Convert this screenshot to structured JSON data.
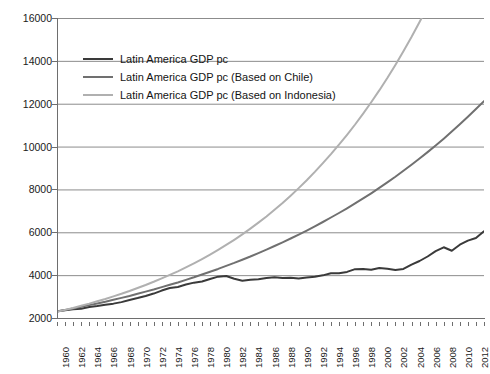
{
  "chart_data": {
    "type": "line",
    "title": "",
    "subtitle": "",
    "xlabel": "",
    "ylabel": "",
    "xlim": [
      1960,
      2013
    ],
    "ylim": [
      2000,
      16000
    ],
    "grid": true,
    "legend_position": "inside-upper-left",
    "y_ticks": [
      2000,
      4000,
      6000,
      8000,
      10000,
      12000,
      14000,
      16000
    ],
    "x_tick_labels": [
      "1960",
      "1962",
      "1964",
      "1966",
      "1968",
      "1970",
      "1972",
      "1974",
      "1976",
      "1978",
      "1980",
      "1982",
      "1984",
      "1986",
      "1988",
      "1990",
      "1992",
      "1994",
      "1996",
      "1998",
      "2000",
      "2002",
      "2004",
      "2006",
      "2008",
      "2010",
      "2012"
    ],
    "x": [
      1960,
      1961,
      1962,
      1963,
      1964,
      1965,
      1966,
      1967,
      1968,
      1969,
      1970,
      1971,
      1972,
      1973,
      1974,
      1975,
      1976,
      1977,
      1978,
      1979,
      1980,
      1981,
      1982,
      1983,
      1984,
      1985,
      1986,
      1987,
      1988,
      1989,
      1990,
      1991,
      1992,
      1993,
      1994,
      1995,
      1996,
      1997,
      1998,
      1999,
      2000,
      2001,
      2002,
      2003,
      2004,
      2005,
      2006,
      2007,
      2008,
      2009,
      2010,
      2011,
      2012,
      2013
    ],
    "series": [
      {
        "name": "Latin America GDP pc",
        "color": "#3a3a3a",
        "width": 2.0,
        "values": [
          2310,
          2360,
          2410,
          2430,
          2510,
          2560,
          2620,
          2670,
          2740,
          2840,
          2930,
          3030,
          3140,
          3280,
          3400,
          3450,
          3560,
          3650,
          3700,
          3820,
          3930,
          3960,
          3830,
          3740,
          3790,
          3810,
          3870,
          3900,
          3870,
          3880,
          3840,
          3890,
          3930,
          3990,
          4090,
          4090,
          4150,
          4280,
          4290,
          4250,
          4330,
          4300,
          4240,
          4290,
          4490,
          4660,
          4870,
          5120,
          5300,
          5140,
          5420,
          5610,
          5730,
          6050
        ]
      },
      {
        "name": "Latin America GDP pc (Based on Chile)",
        "color": "#707070",
        "width": 2.0,
        "values": [
          2300,
          2370,
          2440,
          2520,
          2600,
          2680,
          2760,
          2850,
          2940,
          3030,
          3130,
          3230,
          3330,
          3440,
          3550,
          3660,
          3780,
          3900,
          4030,
          4160,
          4290,
          4430,
          4570,
          4720,
          4870,
          5030,
          5190,
          5360,
          5530,
          5710,
          5890,
          6080,
          6280,
          6480,
          6690,
          6900,
          7120,
          7350,
          7580,
          7820,
          8070,
          8330,
          8590,
          8870,
          9150,
          9440,
          9740,
          10050,
          10370,
          10700,
          11040,
          11390,
          11750,
          12120
        ]
      },
      {
        "name": "Latin America GDP pc (Based on Indonesia)",
        "color": "#b0b0b0",
        "width": 2.0,
        "values": [
          2290,
          2380,
          2470,
          2570,
          2670,
          2780,
          2890,
          3010,
          3130,
          3260,
          3400,
          3540,
          3690,
          3850,
          4010,
          4180,
          4360,
          4550,
          4750,
          4960,
          5180,
          5410,
          5650,
          5900,
          6170,
          6450,
          6740,
          7050,
          7370,
          7710,
          8060,
          8430,
          8820,
          9230,
          9650,
          10090,
          10550,
          11030,
          11540,
          12070,
          12620,
          13200,
          13810,
          14450,
          15110,
          15810,
          16540,
          17300,
          18100,
          18930,
          19800,
          20710,
          21660,
          22650
        ]
      }
    ]
  },
  "legend": {
    "items": [
      {
        "label": "Latin America GDP pc",
        "color": "#3a3a3a"
      },
      {
        "label": "Latin America GDP pc (Based on Chile)",
        "color": "#707070"
      },
      {
        "label": "Latin America GDP pc (Based on Indonesia)",
        "color": "#b0b0b0"
      }
    ]
  }
}
